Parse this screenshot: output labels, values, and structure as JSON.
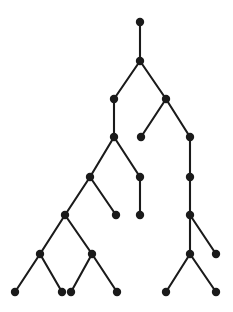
{
  "figure": {
    "name": "binary-tree-diagram",
    "type": "node-link-tree",
    "background_color": "#ffffff",
    "node_color": "#1a1a1a",
    "edge_color": "#1a1a1a",
    "node_radius": 4.2,
    "edge_width": 2.1,
    "width": 233,
    "height": 312,
    "title": "",
    "caption": "",
    "labels": []
  },
  "chart_data": {
    "type": "tree",
    "title": "",
    "node_count": 26,
    "edge_count": 25,
    "depth_levels": [
      22,
      61,
      99,
      137,
      177,
      215,
      254,
      292
    ],
    "nodes": [
      {
        "id": "n0",
        "label": "",
        "x": 140,
        "y": 22,
        "level": 0,
        "role": "root"
      },
      {
        "id": "n1",
        "label": "",
        "x": 140,
        "y": 61,
        "level": 1,
        "role": "internal"
      },
      {
        "id": "n2",
        "label": "",
        "x": 114,
        "y": 99,
        "level": 2,
        "role": "internal"
      },
      {
        "id": "n3",
        "label": "",
        "x": 166,
        "y": 99,
        "level": 2,
        "role": "internal"
      },
      {
        "id": "n4",
        "label": "",
        "x": 114,
        "y": 137,
        "level": 3,
        "role": "internal"
      },
      {
        "id": "n5",
        "label": "",
        "x": 141,
        "y": 137,
        "level": 3,
        "role": "leaf"
      },
      {
        "id": "n6",
        "label": "",
        "x": 190,
        "y": 137,
        "level": 3,
        "role": "internal"
      },
      {
        "id": "n7",
        "label": "",
        "x": 90,
        "y": 177,
        "level": 4,
        "role": "internal"
      },
      {
        "id": "n8",
        "label": "",
        "x": 140,
        "y": 177,
        "level": 4,
        "role": "internal"
      },
      {
        "id": "n9",
        "label": "",
        "x": 190,
        "y": 177,
        "level": 4,
        "role": "internal"
      },
      {
        "id": "n10",
        "label": "",
        "x": 65,
        "y": 215,
        "level": 5,
        "role": "internal"
      },
      {
        "id": "n11",
        "label": "",
        "x": 116,
        "y": 215,
        "level": 5,
        "role": "leaf"
      },
      {
        "id": "n12",
        "label": "",
        "x": 140,
        "y": 215,
        "level": 5,
        "role": "leaf"
      },
      {
        "id": "n13",
        "label": "",
        "x": 190,
        "y": 215,
        "level": 5,
        "role": "internal"
      },
      {
        "id": "n14",
        "label": "",
        "x": 40,
        "y": 254,
        "level": 6,
        "role": "internal"
      },
      {
        "id": "n15",
        "label": "",
        "x": 92,
        "y": 254,
        "level": 6,
        "role": "internal"
      },
      {
        "id": "n16",
        "label": "",
        "x": 190,
        "y": 254,
        "level": 6,
        "role": "internal"
      },
      {
        "id": "n17",
        "label": "",
        "x": 216,
        "y": 254,
        "level": 6,
        "role": "leaf"
      },
      {
        "id": "n18",
        "label": "",
        "x": 15,
        "y": 292,
        "level": 7,
        "role": "leaf"
      },
      {
        "id": "n19",
        "label": "",
        "x": 62,
        "y": 292,
        "level": 7,
        "role": "leaf"
      },
      {
        "id": "n20",
        "label": "",
        "x": 71,
        "y": 292,
        "level": 7,
        "role": "leaf"
      },
      {
        "id": "n21",
        "label": "",
        "x": 117,
        "y": 292,
        "level": 7,
        "role": "leaf"
      },
      {
        "id": "n22",
        "label": "",
        "x": 166,
        "y": 292,
        "level": 7,
        "role": "leaf"
      },
      {
        "id": "n23",
        "label": "",
        "x": 216,
        "y": 292,
        "level": 7,
        "role": "leaf"
      }
    ],
    "edges": [
      {
        "from": "n0",
        "to": "n1"
      },
      {
        "from": "n1",
        "to": "n2"
      },
      {
        "from": "n1",
        "to": "n3"
      },
      {
        "from": "n2",
        "to": "n4"
      },
      {
        "from": "n3",
        "to": "n5"
      },
      {
        "from": "n3",
        "to": "n6"
      },
      {
        "from": "n4",
        "to": "n7"
      },
      {
        "from": "n4",
        "to": "n8"
      },
      {
        "from": "n6",
        "to": "n9"
      },
      {
        "from": "n7",
        "to": "n10"
      },
      {
        "from": "n7",
        "to": "n11"
      },
      {
        "from": "n8",
        "to": "n12"
      },
      {
        "from": "n9",
        "to": "n13"
      },
      {
        "from": "n10",
        "to": "n14"
      },
      {
        "from": "n10",
        "to": "n15"
      },
      {
        "from": "n13",
        "to": "n16"
      },
      {
        "from": "n13",
        "to": "n17"
      },
      {
        "from": "n14",
        "to": "n18"
      },
      {
        "from": "n14",
        "to": "n19"
      },
      {
        "from": "n15",
        "to": "n20"
      },
      {
        "from": "n15",
        "to": "n21"
      },
      {
        "from": "n16",
        "to": "n22"
      },
      {
        "from": "n16",
        "to": "n23"
      }
    ]
  }
}
